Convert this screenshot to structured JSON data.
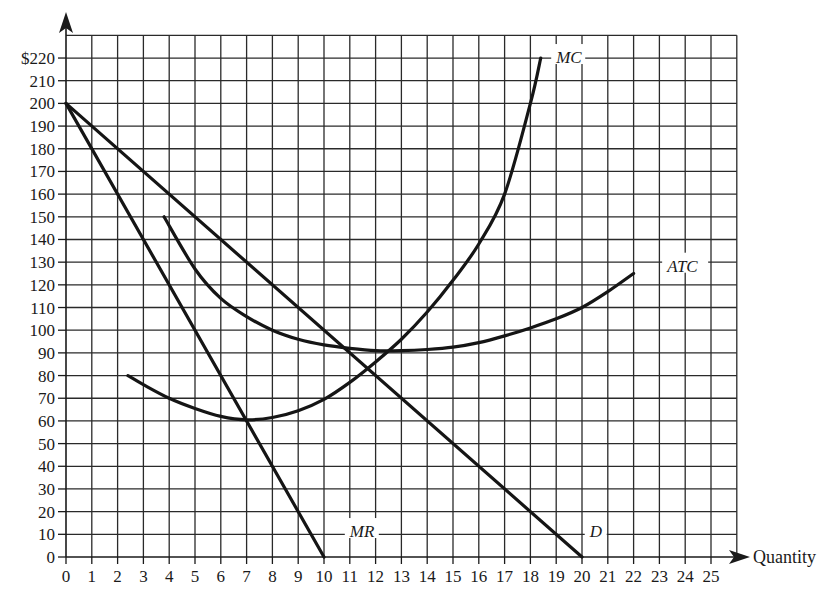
{
  "chart_data": {
    "type": "line",
    "title": "",
    "xlabel": "Quantity",
    "ylabel": "",
    "xlim": [
      0,
      26
    ],
    "ylim": [
      0,
      230
    ],
    "grid": true,
    "x_ticks": [
      0,
      1,
      2,
      3,
      4,
      5,
      6,
      7,
      8,
      9,
      10,
      11,
      12,
      13,
      14,
      15,
      16,
      17,
      18,
      19,
      20,
      21,
      22,
      23,
      24,
      25
    ],
    "y_ticks": [
      0,
      10,
      20,
      30,
      40,
      50,
      60,
      70,
      80,
      90,
      100,
      110,
      120,
      130,
      140,
      150,
      160,
      170,
      180,
      190,
      200,
      210,
      220
    ],
    "y_tick_labels": [
      "0",
      "10",
      "20",
      "30",
      "40",
      "50",
      "60",
      "70",
      "80",
      "90",
      "100",
      "110",
      "120",
      "130",
      "140",
      "150",
      "160",
      "170",
      "180",
      "190",
      "200",
      "210",
      "$220"
    ],
    "series": [
      {
        "name": "D",
        "label": "D",
        "points": [
          [
            0,
            200
          ],
          [
            20,
            0
          ]
        ]
      },
      {
        "name": "MR",
        "label": "MR",
        "points": [
          [
            0,
            200
          ],
          [
            10,
            0
          ]
        ]
      },
      {
        "name": "MC",
        "label": "MC",
        "points": [
          [
            2.4,
            80
          ],
          [
            3,
            76
          ],
          [
            4,
            70
          ],
          [
            5,
            65.5
          ],
          [
            6,
            62
          ],
          [
            7,
            60.5
          ],
          [
            8,
            61.5
          ],
          [
            9,
            64.5
          ],
          [
            10,
            69.5
          ],
          [
            11,
            77
          ],
          [
            12,
            86
          ],
          [
            13,
            96
          ],
          [
            14,
            108
          ],
          [
            15,
            122
          ],
          [
            16,
            138
          ],
          [
            17,
            160
          ],
          [
            18,
            200
          ],
          [
            18.4,
            220
          ]
        ]
      },
      {
        "name": "ATC",
        "label": "ATC",
        "points": [
          [
            3.8,
            150
          ],
          [
            5,
            127
          ],
          [
            6,
            114
          ],
          [
            7,
            106
          ],
          [
            8,
            100
          ],
          [
            9,
            96
          ],
          [
            10,
            93.5
          ],
          [
            11,
            92
          ],
          [
            12,
            91
          ],
          [
            13,
            91
          ],
          [
            14,
            91.5
          ],
          [
            15,
            92.5
          ],
          [
            16,
            94.5
          ],
          [
            17,
            97.5
          ],
          [
            18,
            101
          ],
          [
            19,
            105
          ],
          [
            20,
            110
          ],
          [
            21,
            117
          ],
          [
            22,
            125
          ]
        ]
      }
    ],
    "annotations": [
      {
        "text": "MC",
        "x": 19,
        "y": 220
      },
      {
        "text": "ATC",
        "x": 23.3,
        "y": 128
      },
      {
        "text": "MR",
        "x": 11,
        "y": 11
      },
      {
        "text": "D",
        "x": 20.3,
        "y": 11
      }
    ],
    "legend": "none (curves labeled inline)"
  },
  "labels": {
    "x_axis_title": "Quantity",
    "mc": "MC",
    "atc": "ATC",
    "mr": "MR",
    "d": "D"
  }
}
